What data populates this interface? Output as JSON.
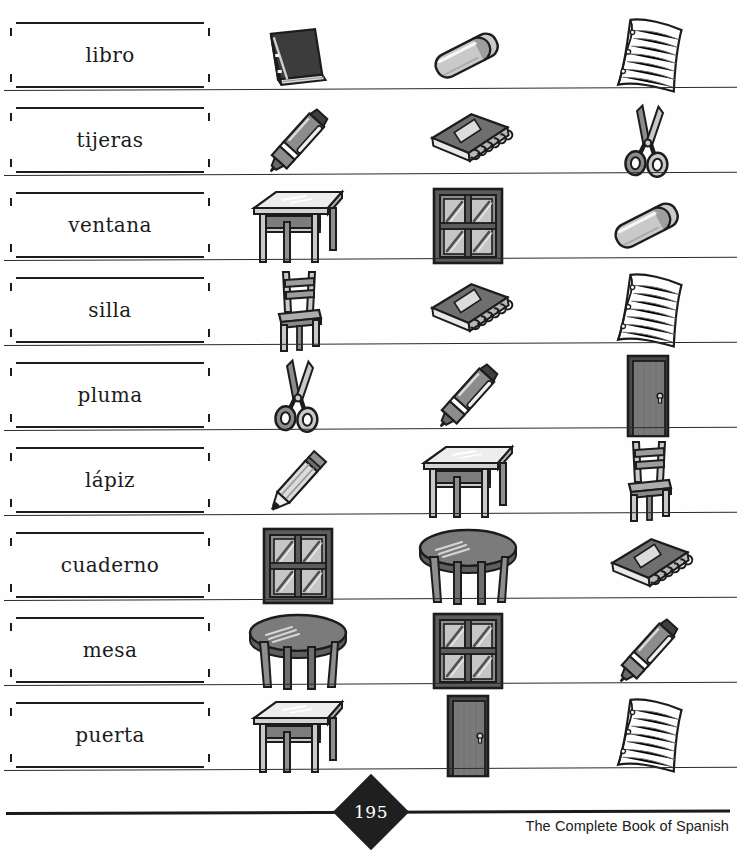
{
  "worksheet": {
    "page_number": "195",
    "book_title": "The Complete Book of Spanish",
    "rows": [
      {
        "word": "libro",
        "pictures": [
          "book",
          "eraser",
          "paper"
        ]
      },
      {
        "word": "tijeras",
        "pictures": [
          "pen",
          "notebook",
          "scissors"
        ]
      },
      {
        "word": "ventana",
        "pictures": [
          "desk",
          "window",
          "eraser"
        ]
      },
      {
        "word": "silla",
        "pictures": [
          "chair",
          "notebook",
          "paper"
        ]
      },
      {
        "word": "pluma",
        "pictures": [
          "scissors",
          "pen",
          "door"
        ]
      },
      {
        "word": "lápiz",
        "pictures": [
          "pencil",
          "desk",
          "chair"
        ]
      },
      {
        "word": "cuaderno",
        "pictures": [
          "window",
          "table",
          "notebook"
        ]
      },
      {
        "word": "mesa",
        "pictures": [
          "table",
          "window",
          "pen"
        ]
      },
      {
        "word": "puerta",
        "pictures": [
          "desk",
          "door",
          "paper"
        ]
      }
    ]
  },
  "palette": {
    "ink": "#1c1c1c",
    "dark_fill": "#4a4a4a",
    "mid_fill": "#8c8c8c",
    "light_fill": "#c9c9c9",
    "pale_fill": "#e4e4e4",
    "paper": "#ffffff"
  }
}
